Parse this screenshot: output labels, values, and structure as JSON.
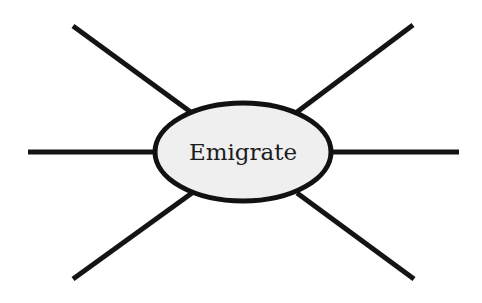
{
  "diagram": {
    "type": "spider-map",
    "center": {
      "label": "Emigrate",
      "shape": "ellipse",
      "fill": "#efefef",
      "stroke": "#111111"
    },
    "spokes": [
      {
        "id": "top-left",
        "label": ""
      },
      {
        "id": "top-right",
        "label": ""
      },
      {
        "id": "left",
        "label": ""
      },
      {
        "id": "right",
        "label": ""
      },
      {
        "id": "bottom-left",
        "label": ""
      },
      {
        "id": "bottom-right",
        "label": ""
      }
    ],
    "line_color": "#141414",
    "background": "#ffffff"
  }
}
